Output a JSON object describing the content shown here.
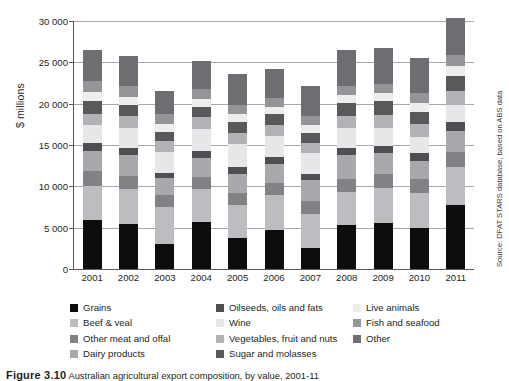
{
  "chart_data": {
    "type": "bar",
    "stacked": true,
    "title": "",
    "xlabel": "",
    "ylabel": "$ millions",
    "ylim": [
      0,
      30000
    ],
    "ytick_values": [
      0,
      5000,
      10000,
      15000,
      20000,
      25000,
      30000
    ],
    "ytick_labels": [
      "0",
      "5000",
      "10000",
      "15000",
      "20000",
      "25000",
      "30000"
    ],
    "grid": true,
    "legend_position": "below",
    "categories": [
      "2001",
      "2002",
      "2003",
      "2004",
      "2005",
      "2006",
      "2007",
      "2008",
      "2009",
      "2010",
      "2011"
    ],
    "series": [
      {
        "name": "Grains",
        "color": "#0d0d0d",
        "values": [
          5900,
          5400,
          3000,
          5700,
          3800,
          4700,
          2500,
          5300,
          5600,
          5000,
          7800
        ]
      },
      {
        "name": "Beef & veal",
        "color": "#bcbdc0",
        "values": [
          4200,
          4300,
          4500,
          4000,
          4000,
          4200,
          4200,
          4000,
          4200,
          4200,
          4500
        ]
      },
      {
        "name": "Other meat and offal",
        "color": "#808285",
        "values": [
          1700,
          1500,
          1500,
          1400,
          1400,
          1500,
          1500,
          1600,
          1700,
          1700,
          1800
        ]
      },
      {
        "name": "Dairy products",
        "color": "#a7a9ac",
        "values": [
          2500,
          2600,
          2000,
          2300,
          2300,
          2300,
          2600,
          2900,
          2500,
          2200,
          2600
        ]
      },
      {
        "name": "Oilseeds, oils and fats",
        "color": "#4d4f53",
        "values": [
          900,
          900,
          600,
          900,
          800,
          800,
          700,
          900,
          900,
          900,
          1100
        ]
      },
      {
        "name": "Wine",
        "color": "#e6e7e8",
        "values": [
          2200,
          2400,
          2600,
          2700,
          2800,
          2600,
          2500,
          2400,
          2200,
          2000,
          2000
        ]
      },
      {
        "name": "Vegetables, fruit and nuts",
        "color": "#b0b2b5",
        "values": [
          1400,
          1400,
          1300,
          1400,
          1400,
          1300,
          1300,
          1400,
          1500,
          1500,
          1700
        ]
      },
      {
        "name": "Sugar and molasses",
        "color": "#58595b",
        "values": [
          1500,
          1300,
          1100,
          1200,
          1300,
          1300,
          1200,
          1600,
          1700,
          1500,
          1900
        ]
      },
      {
        "name": "Live animals",
        "color": "#eceded",
        "values": [
          1100,
          1000,
          1000,
          1000,
          900,
          900,
          900,
          1000,
          1000,
          1100,
          1200
        ]
      },
      {
        "name": "Fish and seafood",
        "color": "#939598",
        "values": [
          1400,
          1300,
          1200,
          1200,
          1200,
          1100,
          1100,
          1100,
          1100,
          1200,
          1300
        ]
      },
      {
        "name": "Other",
        "color": "#6d6e71",
        "values": [
          3700,
          3700,
          2800,
          3400,
          3700,
          3500,
          3700,
          4300,
          4400,
          4200,
          4500
        ]
      }
    ],
    "totals": [
      26500,
      25800,
      20600,
      25200,
      23600,
      24200,
      22200,
      26500,
      26800,
      26400,
      29200
    ],
    "source_note": "Source: DFAT STARS database, based on ABS data"
  },
  "legend": {
    "columns": [
      [
        {
          "label": "Grains",
          "swatch": "legend-swatch-grains",
          "color": "#0d0d0d"
        },
        {
          "label": "Beef & veal",
          "swatch": "legend-swatch-beef-veal",
          "color": "#bcbdc0"
        },
        {
          "label": "Other meat and offal",
          "swatch": "legend-swatch-other-meat-offal",
          "color": "#808285"
        },
        {
          "label": "Dairy products",
          "swatch": "legend-swatch-dairy-products",
          "color": "#a7a9ac"
        }
      ],
      [
        {
          "label": "Oilseeds, oils and fats",
          "swatch": "legend-swatch-oilseeds",
          "color": "#4d4f53"
        },
        {
          "label": "Wine",
          "swatch": "legend-swatch-wine",
          "color": "#e6e7e8"
        },
        {
          "label": "Vegetables, fruit and nuts",
          "swatch": "legend-swatch-vegetables",
          "color": "#b0b2b5"
        },
        {
          "label": "Sugar and molasses",
          "swatch": "legend-swatch-sugar",
          "color": "#58595b"
        }
      ],
      [
        {
          "label": "Live animals",
          "swatch": "legend-swatch-live-animals",
          "color": "#eceded"
        },
        {
          "label": "Fish and seafood",
          "swatch": "legend-swatch-fish-seafood",
          "color": "#939598"
        },
        {
          "label": "Other",
          "swatch": "legend-swatch-other",
          "color": "#6d6e71"
        }
      ]
    ]
  },
  "caption": {
    "figure_number": "Figure 3.10",
    "text": "Australian agricultural export composition, by value, 2001-11"
  }
}
